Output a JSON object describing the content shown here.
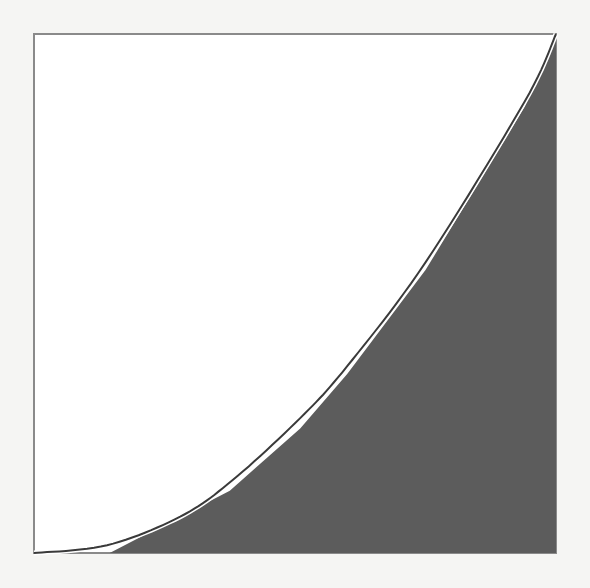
{
  "figure": {
    "frame": {
      "x": 34,
      "y": 34,
      "width": 522,
      "height": 519
    },
    "colors": {
      "page": "#f5f5f3",
      "frame_stroke": "#8a8a8a",
      "fill": "#5c5c5c",
      "curve": "#3a3a3a",
      "gap": "#ffffff"
    }
  },
  "chart_data": {
    "type": "area",
    "title": "",
    "xlabel": "",
    "ylabel": "",
    "xlim": [
      0,
      1
    ],
    "ylim": [
      0,
      1
    ],
    "grid": false,
    "legend": null,
    "series": [
      {
        "name": "convex curve (upper boundary)",
        "style": "line",
        "x": [
          0.0,
          0.14,
          0.28,
          0.38,
          0.51,
          0.6,
          0.75,
          0.94,
          1.0
        ],
        "y": [
          0.0,
          0.015,
          0.07,
          0.14,
          0.26,
          0.36,
          0.56,
          0.87,
          1.0
        ]
      },
      {
        "name": "shaded piecewise-linear region",
        "style": "filled-polygon",
        "x": [
          0.145,
          0.375,
          0.51,
          0.6,
          0.75,
          0.94,
          1.0,
          1.0
        ],
        "y": [
          0.0,
          0.12,
          0.24,
          0.345,
          0.545,
          0.86,
          1.0,
          0.0
        ]
      }
    ]
  }
}
